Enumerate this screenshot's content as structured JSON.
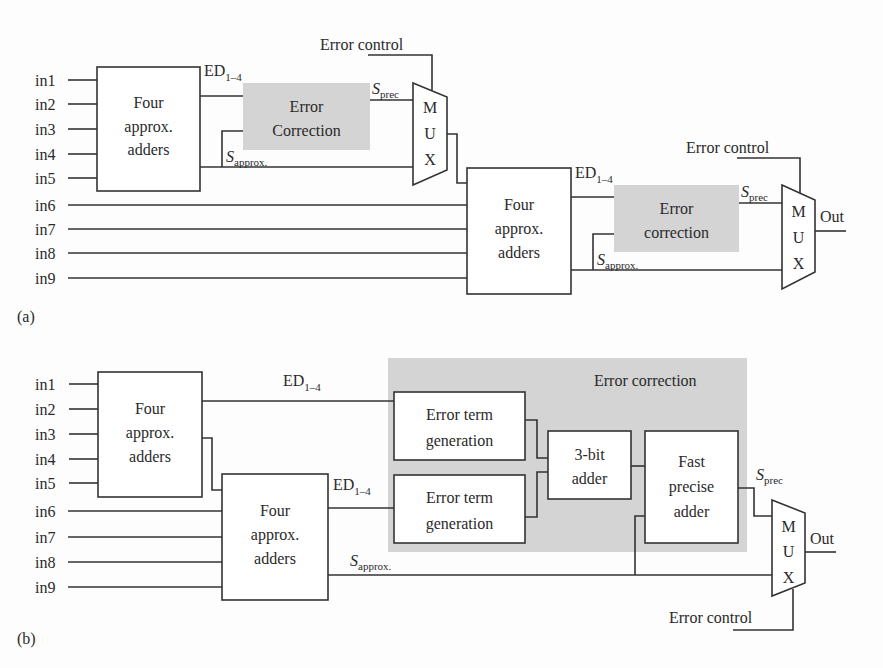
{
  "diagram_a": {
    "label": "(a)",
    "inputs": [
      "in1",
      "in2",
      "in3",
      "in4",
      "in5",
      "in6",
      "in7",
      "in8",
      "in9"
    ],
    "adder1": {
      "line1": "Four",
      "line2": "approx.",
      "line3": "adders"
    },
    "adder2": {
      "line1": "Four",
      "line2": "approx.",
      "line3": "adders"
    },
    "ed_label_main": "ED",
    "ed_label_sub": "1–4",
    "error_correction_1": {
      "line1": "Error",
      "line2": "Correction"
    },
    "error_correction_2": {
      "line1": "Error",
      "line2": "correction"
    },
    "s_prec_main": "S",
    "s_prec_sub": "prec",
    "s_approx_main": "S",
    "s_approx_sub": "approx.",
    "error_control": "Error control",
    "mux_letters": [
      "M",
      "U",
      "X"
    ],
    "output": "Out"
  },
  "diagram_b": {
    "label": "(b)",
    "inputs": [
      "in1",
      "in2",
      "in3",
      "in4",
      "in5",
      "in6",
      "in7",
      "in8",
      "in9"
    ],
    "adder1": {
      "line1": "Four",
      "line2": "approx.",
      "line3": "adders"
    },
    "adder2": {
      "line1": "Four",
      "line2": "approx.",
      "line3": "adders"
    },
    "ed_label_main": "ED",
    "ed_label_sub": "1–4",
    "error_correction_title": "Error correction",
    "error_term_gen_1": {
      "line1": "Error term",
      "line2": "generation"
    },
    "error_term_gen_2": {
      "line1": "Error term",
      "line2": "generation"
    },
    "three_bit_adder": {
      "line1": "3-bit",
      "line2": "adder"
    },
    "fast_precise_adder": {
      "line1": "Fast",
      "line2": "precise",
      "line3": "adder"
    },
    "s_prec_main": "S",
    "s_prec_sub": "prec",
    "s_approx_main": "S",
    "s_approx_sub": "approx.",
    "error_control": "Error control",
    "mux_letters": [
      "M",
      "U",
      "X"
    ],
    "output": "Out"
  },
  "colors": {
    "line": "#333333",
    "shaded_block": "#d4d4d4",
    "text": "#2a2a2a"
  }
}
